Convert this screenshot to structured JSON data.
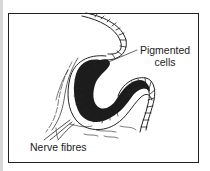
{
  "diagram": {
    "labels": {
      "pigmented_line1": "Pigmented",
      "pigmented_line2": "cells",
      "nerve": "Nerve fibres"
    },
    "colors": {
      "ink": "#222222",
      "frame": "#222222",
      "background": "#ffffff"
    }
  }
}
